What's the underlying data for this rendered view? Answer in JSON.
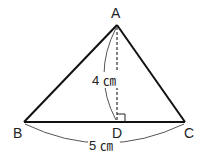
{
  "diagram": {
    "type": "triangle",
    "vertices": {
      "A": {
        "label": "A",
        "x": 117,
        "y": 25
      },
      "B": {
        "label": "B",
        "x": 24,
        "y": 122
      },
      "C": {
        "label": "C",
        "x": 185,
        "y": 122
      },
      "D": {
        "label": "D",
        "x": 117,
        "y": 122
      }
    },
    "height_label": "4 ㎝",
    "base_label": "5 ㎝",
    "right_angle_at": "D",
    "colors": {
      "stroke": "#111111",
      "text": "#222222",
      "arc": "#555555"
    }
  }
}
